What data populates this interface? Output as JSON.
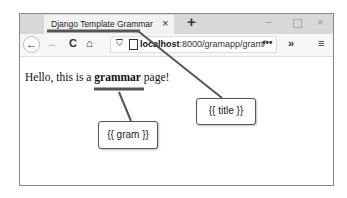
{
  "browser": {
    "tab": {
      "title": "Django Template Grammar",
      "close_icon": "×"
    },
    "new_tab_icon": "+",
    "window_controls": {
      "minimize": "–",
      "maximize": "□",
      "close": "×"
    },
    "toolbar": {
      "back_icon": "←",
      "forward_icon": "→",
      "reload_icon": "C",
      "home_icon": "⌂",
      "shield_icon": "⛉",
      "url_host": "localhost",
      "url_rest": ":8000/gramapp/gram/",
      "url_more": "•••",
      "overflow_icon": "»",
      "menu_icon": "≡"
    }
  },
  "page": {
    "text_before": "Hello, this is a ",
    "text_bold": "grammar",
    "text_after": " page!"
  },
  "annotations": {
    "title_callout": "{{ title }}",
    "gram_callout": "{{ gram }}",
    "line_color": "#555555"
  }
}
